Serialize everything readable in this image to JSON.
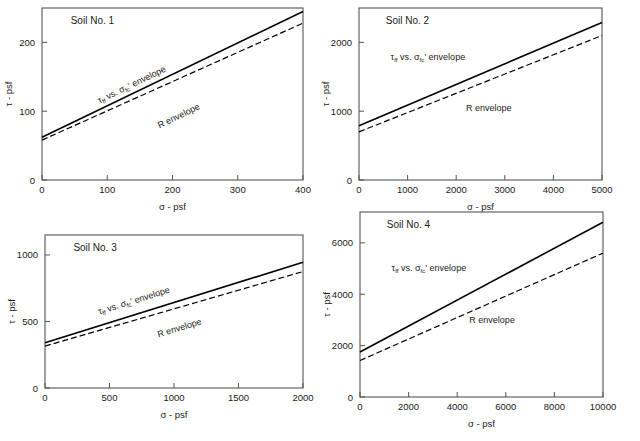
{
  "figure": {
    "panel_count": 4,
    "line_colors": {
      "tff_envelope": "#000000",
      "r_envelope": "#000000"
    },
    "frame_color": "#555555",
    "background": "#ffffff"
  },
  "labels": {
    "x_axis_title": "σ - psf",
    "y_axis_title": "τ - psf",
    "tff_text_pre": "τ",
    "tff_text_sub": "ff",
    "tff_text_mid": " vs. ",
    "sigma_sym": "σ",
    "sigma_sub": "fc",
    "sigma_prime": "'",
    "tff_text_post": " envelope",
    "r_envelope": "R envelope"
  },
  "chart_data": [
    {
      "type": "line",
      "title": "Soil No. 1",
      "xlabel": "σ - psf",
      "ylabel": "τ - psf",
      "xlim": [
        0,
        400
      ],
      "ylim": [
        0,
        250
      ],
      "xticks": [
        0,
        100,
        200,
        300,
        400
      ],
      "yticks": [
        0,
        100,
        200
      ],
      "xticklabels": [
        "0",
        "100",
        "200",
        "300",
        "400"
      ],
      "yticklabels": [
        "0",
        "100",
        "200"
      ],
      "grid": false,
      "legend": "inline-annotation",
      "series": [
        {
          "name": "τff vs. σfc' envelope",
          "style": "solid",
          "x": [
            0,
            400
          ],
          "y": [
            62,
            245
          ]
        },
        {
          "name": "R envelope",
          "style": "dashed",
          "x": [
            0,
            400
          ],
          "y": [
            58,
            228
          ]
        }
      ],
      "annotations": [
        {
          "text": "τff vs. σfc' envelope",
          "rotated": true
        },
        {
          "text": "R envelope",
          "rotated": true
        }
      ]
    },
    {
      "type": "line",
      "title": "Soil No. 2",
      "xlabel": "σ - psf",
      "ylabel": "τ - psf",
      "xlim": [
        0,
        5000
      ],
      "ylim": [
        0,
        2500
      ],
      "xticks": [
        0,
        1000,
        2000,
        3000,
        4000,
        5000
      ],
      "yticks": [
        0,
        1000,
        2000
      ],
      "xticklabels": [
        "0",
        "1000",
        "2000",
        "3000",
        "4000",
        "5000"
      ],
      "yticklabels": [
        "0",
        "1000",
        "2000"
      ],
      "grid": false,
      "legend": "inline-annotation",
      "series": [
        {
          "name": "τff vs. σfc' envelope",
          "style": "solid",
          "x": [
            0,
            5000
          ],
          "y": [
            790,
            2290
          ]
        },
        {
          "name": "R envelope",
          "style": "dashed",
          "x": [
            0,
            5000
          ],
          "y": [
            700,
            2100
          ]
        }
      ],
      "annotations": [
        {
          "text": "τff vs. σfc' envelope",
          "rotated": false
        },
        {
          "text": "R envelope",
          "rotated": false
        }
      ]
    },
    {
      "type": "line",
      "title": "Soil No. 3",
      "xlabel": "σ - psf",
      "ylabel": "τ - psf",
      "xlim": [
        0,
        2000
      ],
      "ylim": [
        0,
        1150
      ],
      "xticks": [
        0,
        500,
        1000,
        1500,
        2000
      ],
      "yticks": [
        0,
        500,
        1000
      ],
      "xticklabels": [
        "0",
        "500",
        "1000",
        "1500",
        "2000"
      ],
      "yticklabels": [
        "0",
        "500",
        "1000"
      ],
      "grid": false,
      "legend": "inline-annotation",
      "series": [
        {
          "name": "τff vs. σfc' envelope",
          "style": "solid",
          "x": [
            0,
            2000
          ],
          "y": [
            340,
            945
          ]
        },
        {
          "name": "R envelope",
          "style": "dashed",
          "x": [
            0,
            2000
          ],
          "y": [
            315,
            875
          ]
        }
      ],
      "annotations": [
        {
          "text": "τff vs. σfc' envelope",
          "rotated": true
        },
        {
          "text": "R envelope",
          "rotated": true
        }
      ]
    },
    {
      "type": "line",
      "title": "Soil No. 4",
      "xlabel": "σ - psf",
      "ylabel": "τ - psf",
      "xlim": [
        0,
        10000
      ],
      "ylim": [
        0,
        7200
      ],
      "xticks": [
        0,
        2000,
        4000,
        6000,
        8000,
        10000
      ],
      "yticks": [
        0,
        2000,
        4000,
        6000
      ],
      "xticklabels": [
        "0",
        "2000",
        "4000",
        "6000",
        "8000",
        "10000"
      ],
      "yticklabels": [
        "0",
        "2000",
        "4000",
        "6000"
      ],
      "grid": false,
      "legend": "inline-annotation",
      "series": [
        {
          "name": "τff vs. σfc' envelope",
          "style": "solid",
          "x": [
            0,
            10000
          ],
          "y": [
            1750,
            6800
          ]
        },
        {
          "name": "R envelope",
          "style": "dashed",
          "x": [
            0,
            10000
          ],
          "y": [
            1420,
            5600
          ]
        }
      ],
      "annotations": [
        {
          "text": "τff vs. σfc' envelope",
          "rotated": false
        },
        {
          "text": "R envelope",
          "rotated": false
        }
      ]
    }
  ]
}
